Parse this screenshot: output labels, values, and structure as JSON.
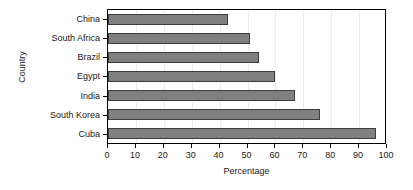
{
  "chart_data": {
    "type": "bar",
    "orientation": "horizontal",
    "title": "",
    "xlabel": "Percentage",
    "ylabel": "Country",
    "categories": [
      "China",
      "South Africa",
      "Brazil",
      "Egypt",
      "India",
      "South Korea",
      "Cuba"
    ],
    "values": [
      43,
      51,
      54,
      60,
      67,
      76,
      96
    ],
    "xlim": [
      0,
      100
    ],
    "xticks": [
      0,
      10,
      20,
      30,
      40,
      50,
      60,
      70,
      80,
      90,
      100
    ],
    "xtick_labels": [
      "0",
      "10",
      "20",
      "30",
      "40",
      "50",
      "60",
      "70",
      "80",
      "90",
      "100"
    ],
    "grid": true,
    "legend": null,
    "bar_color": "#808080",
    "bar_edge_color": "#3d3d3d",
    "grid_color": "#ececec",
    "axis_color": "#000000",
    "text_color": "#1a1a1a"
  }
}
